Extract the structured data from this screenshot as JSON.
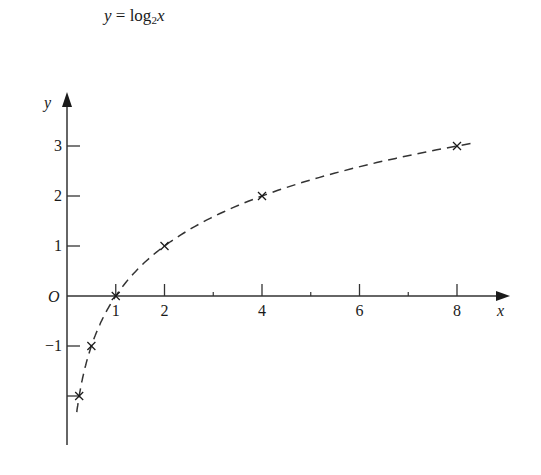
{
  "title": {
    "lhs": "y",
    "eq": " = ",
    "fn": "log",
    "base": "2",
    "arg": "x"
  },
  "chart_data": {
    "type": "line",
    "xlabel": "x",
    "ylabel": "y",
    "origin_label": "O",
    "line_style": "dashed",
    "marker": "x",
    "x": [
      0.25,
      0.5,
      1,
      2,
      4,
      8
    ],
    "y": [
      -2,
      -1,
      0,
      1,
      2,
      3
    ],
    "x_ticks_major": [
      1,
      2,
      4,
      6,
      8
    ],
    "x_tick_labels": [
      "1",
      "2",
      "4",
      "6",
      "8"
    ],
    "x_ticks_minor": [
      3,
      5,
      7
    ],
    "y_ticks": [
      -2,
      -1,
      1,
      2,
      3
    ],
    "y_tick_labels": [
      "−1",
      "1",
      "2",
      "3"
    ],
    "y_tick_label_values": [
      -1,
      1,
      2,
      3
    ],
    "xlim": [
      0,
      9
    ],
    "ylim": [
      -2.6,
      4
    ],
    "grid": false,
    "legend": false
  }
}
